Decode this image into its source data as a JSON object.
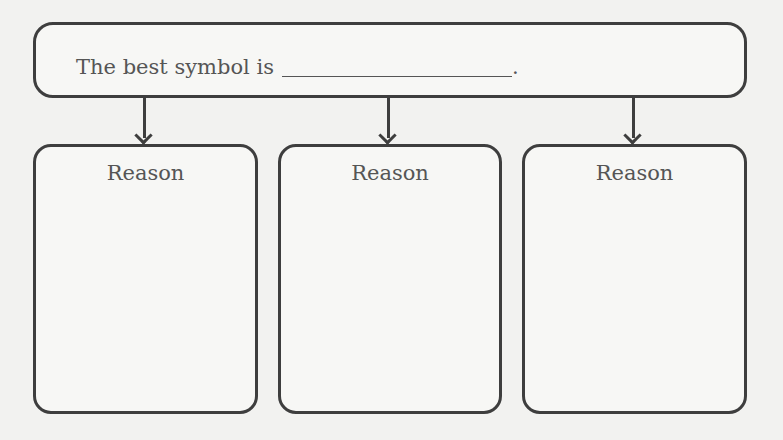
{
  "prompt": {
    "text": "The best symbol is",
    "trailing": "."
  },
  "reasons": [
    {
      "label": "Reason"
    },
    {
      "label": "Reason"
    },
    {
      "label": "Reason"
    }
  ]
}
